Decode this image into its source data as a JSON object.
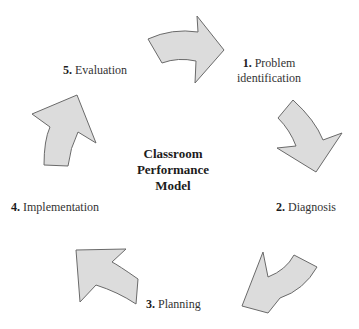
{
  "diagram": {
    "type": "cycle",
    "center_title": {
      "line1": "Classroom",
      "line2": "Performance",
      "line3": "Model"
    },
    "steps": [
      {
        "number": "1.",
        "label_line1": "Problem",
        "label_line2": "identification"
      },
      {
        "number": "2.",
        "label": "Diagnosis"
      },
      {
        "number": "3.",
        "label": "Planning"
      },
      {
        "number": "4.",
        "label": "Implementation"
      },
      {
        "number": "5.",
        "label": "Evaluation"
      }
    ],
    "arrows": [
      {
        "from": "5. Evaluation",
        "to": "1. Problem identification",
        "direction": "right"
      },
      {
        "from": "1. Problem identification",
        "to": "2. Diagnosis",
        "direction": "down"
      },
      {
        "from": "2. Diagnosis",
        "to": "3. Planning",
        "direction": "down-left"
      },
      {
        "from": "3. Planning",
        "to": "4. Implementation",
        "direction": "up-left"
      },
      {
        "from": "4. Implementation",
        "to": "5. Evaluation",
        "direction": "up"
      }
    ],
    "colors": {
      "arrow_fill": "#dcdcdc",
      "arrow_stroke": "#6a6a6a",
      "text": "#333333"
    }
  }
}
